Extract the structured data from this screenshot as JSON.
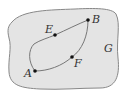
{
  "diagram": {
    "region_label": "G",
    "region_fill": "#e4e4e4",
    "region_stroke": "#888888",
    "curve_color": "#777777",
    "points": [
      {
        "name": "A",
        "x": 35,
        "y": 71
      },
      {
        "name": "E",
        "x": 55,
        "y": 35
      },
      {
        "name": "B",
        "x": 88,
        "y": 20
      },
      {
        "name": "F",
        "x": 72,
        "y": 57
      }
    ]
  }
}
